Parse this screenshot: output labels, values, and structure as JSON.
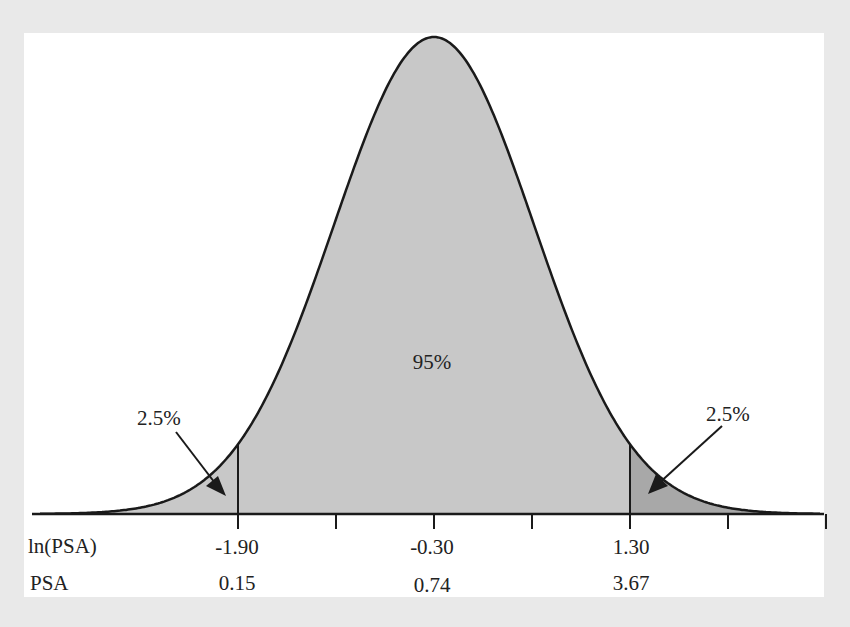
{
  "chart_data": {
    "type": "area",
    "title": "",
    "distribution": {
      "mean": -0.3,
      "sd": 0.816
    },
    "xlabel": "ln(PSA)",
    "secondary_xlabel": "PSA",
    "x_ticks": [
      -1.9,
      -1.1,
      -0.3,
      0.5,
      1.3,
      2.1,
      2.9
    ],
    "labeled_ticks": [
      {
        "ln_psa": "-1.90",
        "psa": "0.15"
      },
      {
        "ln_psa": "-0.30",
        "psa": "0.74"
      },
      {
        "ln_psa": "1.30",
        "psa": "3.67"
      }
    ],
    "regions": [
      {
        "name": "left tail",
        "from": null,
        "to": -1.9,
        "percent": "2.5%",
        "color": "#c8c8c8"
      },
      {
        "name": "central",
        "from": -1.9,
        "to": 1.3,
        "percent": "95%",
        "color": "#c8c8c8"
      },
      {
        "name": "right tail",
        "from": 1.3,
        "to": null,
        "percent": "2.5%",
        "color": "#a8a8a8"
      }
    ],
    "annotations": [
      "2.5%",
      "95%",
      "2.5%"
    ],
    "grid": false,
    "legend": null
  },
  "labels": {
    "axis_row1_title": "ln(PSA)",
    "axis_row2_title": "PSA",
    "ln_left": "-1.90",
    "ln_center": "-0.30",
    "ln_right": "1.30",
    "psa_left": "0.15",
    "psa_center": "0.74",
    "psa_right": "3.67",
    "center_pct": "95%",
    "left_tail_pct": "2.5%",
    "right_tail_pct": "2.5%"
  },
  "colors": {
    "page_bg": "#e9e9e9",
    "panel_bg": "#ffffff",
    "central_fill": "#c8c8c8",
    "right_tail_fill": "#a8a8a8",
    "stroke": "#1a1a1a"
  }
}
